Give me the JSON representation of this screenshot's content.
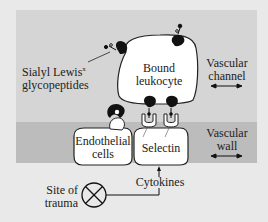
{
  "colors": {
    "background": "#e9e9e9",
    "vascular_channel": "#d5d5d5",
    "vascular_wall": "#bcbcbc",
    "cell_fill": "#ffffff",
    "outline": "#222222",
    "receptor": "#111111"
  },
  "labels": {
    "sialyl_line1": "Sialyl Lewis",
    "sialyl_sup": "x",
    "sialyl_line2": "glycopeptides",
    "leukocyte_line1": "Bound",
    "leukocyte_line2": "leukocyte",
    "channel_line1": "Vascular",
    "channel_line2": "channel",
    "wall_line1": "Vascular",
    "wall_line2": "wall",
    "endothelial_line1": "Endothelial",
    "endothelial_line2": "cells",
    "selectin": "Selectin",
    "trauma_line1": "Site of",
    "trauma_line2": "trauma",
    "cytokines": "Cytokines"
  }
}
